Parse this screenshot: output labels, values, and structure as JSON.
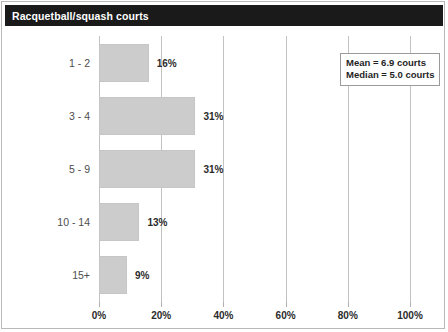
{
  "header": {
    "title": "Racquetball/squash courts"
  },
  "stats": {
    "mean_label": "Mean = 6.9 courts",
    "median_label": "Median = 5.0 courts"
  },
  "colors": {
    "banner": "#1a1a1a",
    "bar_fill": "#cccccc",
    "gridline": "#c2c2c2",
    "frame": "#b9b9b9",
    "label_text": "#4d4d4d"
  },
  "chart_data": {
    "type": "bar",
    "orientation": "horizontal",
    "title": "Racquetball/squash courts",
    "xlabel": "",
    "ylabel": "",
    "categories": [
      "1 - 2",
      "3 - 4",
      "5 - 9",
      "10 - 14",
      "15+"
    ],
    "values": [
      16,
      31,
      31,
      13,
      9
    ],
    "data_labels": [
      "16%",
      "31%",
      "31%",
      "13%",
      "9%"
    ],
    "xlim": [
      0,
      100
    ],
    "xticks": [
      0,
      20,
      40,
      60,
      80,
      100
    ],
    "xtick_labels": [
      "0%",
      "20%",
      "40%",
      "60%",
      "80%",
      "100%"
    ],
    "grid": "vertical",
    "legend_position": "top-right",
    "annotations": [
      "Mean = 6.9 courts",
      "Median = 5.0 courts"
    ]
  }
}
